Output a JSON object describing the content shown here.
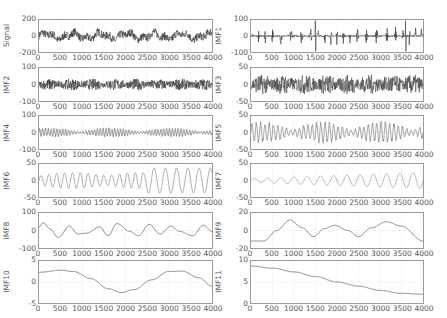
{
  "chart_data": [
    {
      "type": "line",
      "ylabel": "Signal",
      "xlim": [
        0,
        4000
      ],
      "ylim": [
        -200,
        200
      ],
      "yticks": [
        "200",
        "0",
        "-200"
      ],
      "xticks": [
        "0",
        "500",
        "1000",
        "1500",
        "2000",
        "2500",
        "3000",
        "3500",
        "4000"
      ],
      "grid": true,
      "style": "noise",
      "amp": 0.55,
      "freq": 0,
      "line_color": "#333333"
    },
    {
      "type": "line",
      "ylabel": "IMF1",
      "xlim": [
        0,
        4000
      ],
      "ylim": [
        -100,
        100
      ],
      "yticks": [
        "100",
        "0",
        "-100"
      ],
      "xticks": [
        "0",
        "500",
        "1000",
        "1500",
        "2000",
        "2500",
        "3000",
        "3500",
        "4000"
      ],
      "grid": true,
      "style": "bursts",
      "amp": 0.6,
      "freq": 0,
      "line_color": "#333333"
    },
    {
      "type": "line",
      "ylabel": "IMF2",
      "xlim": [
        0,
        4000
      ],
      "ylim": [
        -100,
        100
      ],
      "yticks": [
        "100",
        "0",
        "-100"
      ],
      "xticks": [
        "0",
        "500",
        "1000",
        "1500",
        "2000",
        "2500",
        "3000",
        "3500",
        "4000"
      ],
      "grid": true,
      "style": "dense",
      "amp": 0.35,
      "freq": 0,
      "line_color": "#333333"
    },
    {
      "type": "line",
      "ylabel": "IMF3",
      "xlim": [
        0,
        4000
      ],
      "ylim": [
        -50,
        50
      ],
      "yticks": [
        "50",
        "0",
        "-50"
      ],
      "xticks": [
        "0",
        "500",
        "1000",
        "1500",
        "2000",
        "2500",
        "3000",
        "3500",
        "4000"
      ],
      "grid": true,
      "style": "dense",
      "amp": 0.6,
      "freq": 0,
      "line_color": "#444444"
    },
    {
      "type": "line",
      "ylabel": "IMF4",
      "xlim": [
        0,
        4000
      ],
      "ylim": [
        -100,
        100
      ],
      "yticks": [
        "100",
        "0",
        "-100"
      ],
      "xticks": [
        "0",
        "500",
        "1000",
        "1500",
        "2000",
        "2500",
        "3000",
        "3500",
        "4000"
      ],
      "grid": true,
      "style": "mod",
      "amp": 0.3,
      "freq": 60,
      "line_color": "#555555"
    },
    {
      "type": "line",
      "ylabel": "IMF5",
      "xlim": [
        0,
        4000
      ],
      "ylim": [
        -50,
        50
      ],
      "yticks": [
        "50",
        "0",
        "-50"
      ],
      "xticks": [
        "0",
        "500",
        "1000",
        "1500",
        "2000",
        "2500",
        "3000",
        "3500",
        "4000"
      ],
      "grid": true,
      "style": "mod",
      "amp": 0.7,
      "freq": 40,
      "line_color": "#666666"
    },
    {
      "type": "line",
      "ylabel": "IMF6",
      "xlim": [
        0,
        4000
      ],
      "ylim": [
        -50,
        50
      ],
      "yticks": [
        "50",
        "0",
        "-50"
      ],
      "xticks": [
        "0",
        "500",
        "1000",
        "1500",
        "2000",
        "2500",
        "3000",
        "3500",
        "4000"
      ],
      "grid": true,
      "style": "mod6",
      "amp": 0.8,
      "freq": 22,
      "line_color": "#777777"
    },
    {
      "type": "line",
      "ylabel": "IMF7",
      "xlim": [
        0,
        4000
      ],
      "ylim": [
        -50,
        50
      ],
      "yticks": [
        "50",
        "0",
        "-50"
      ],
      "xticks": [
        "0",
        "500",
        "1000",
        "1500",
        "2000",
        "2500",
        "3000",
        "3500",
        "4000"
      ],
      "grid": true,
      "style": "grow",
      "amp": 0.55,
      "freq": 13,
      "line_color": "#888888"
    },
    {
      "type": "line",
      "ylabel": "IMF8",
      "xlim": [
        0,
        4000
      ],
      "ylim": [
        -100,
        100
      ],
      "yticks": [
        "100",
        "0",
        "-100"
      ],
      "xticks": [
        "0",
        "500",
        "1000",
        "1500",
        "2000",
        "2500",
        "3000",
        "3500",
        "4000"
      ],
      "grid": true,
      "style": "points",
      "points": [
        [
          0,
          20
        ],
        [
          100,
          45
        ],
        [
          250,
          10
        ],
        [
          450,
          -40
        ],
        [
          700,
          25
        ],
        [
          900,
          -20
        ],
        [
          1100,
          -15
        ],
        [
          1400,
          20
        ],
        [
          1600,
          -30
        ],
        [
          1800,
          40
        ],
        [
          2100,
          -5
        ],
        [
          2300,
          -30
        ],
        [
          2550,
          35
        ],
        [
          2800,
          -20
        ],
        [
          3050,
          25
        ],
        [
          3250,
          -5
        ],
        [
          3550,
          -30
        ],
        [
          3800,
          30
        ],
        [
          4000,
          -5
        ]
      ],
      "line_color": "#888888"
    },
    {
      "type": "line",
      "ylabel": "IMF9",
      "xlim": [
        0,
        4000
      ],
      "ylim": [
        -20,
        20
      ],
      "yticks": [
        "20",
        "0",
        "-20"
      ],
      "xticks": [
        "0",
        "500",
        "1000",
        "1500",
        "2000",
        "2500",
        "3000",
        "3500",
        "4000"
      ],
      "grid": true,
      "style": "points",
      "points": [
        [
          0,
          -12
        ],
        [
          300,
          -12
        ],
        [
          600,
          0
        ],
        [
          900,
          12
        ],
        [
          1200,
          3
        ],
        [
          1450,
          -7
        ],
        [
          1700,
          2
        ],
        [
          1950,
          6
        ],
        [
          2250,
          0
        ],
        [
          2500,
          -7
        ],
        [
          2800,
          3
        ],
        [
          3150,
          10
        ],
        [
          3500,
          5
        ],
        [
          4000,
          -12
        ]
      ],
      "line_color": "#888888"
    },
    {
      "type": "line",
      "ylabel": "IMF10",
      "xlim": [
        0,
        4000
      ],
      "ylim": [
        -5,
        5
      ],
      "yticks": [
        "5",
        "0",
        "-5"
      ],
      "xticks": [
        "0",
        "500",
        "1000",
        "1500",
        "2000",
        "2500",
        "3000",
        "3500",
        "4000"
      ],
      "grid": true,
      "style": "points",
      "points": [
        [
          0,
          2.3
        ],
        [
          500,
          2.8
        ],
        [
          800,
          2.5
        ],
        [
          1200,
          0.8
        ],
        [
          1600,
          -1.6
        ],
        [
          1900,
          -2.5
        ],
        [
          2200,
          -1.8
        ],
        [
          2600,
          0.5
        ],
        [
          3000,
          2.5
        ],
        [
          3300,
          2.6
        ],
        [
          3700,
          1.0
        ],
        [
          4000,
          -1.0
        ]
      ],
      "line_color": "#888888"
    },
    {
      "type": "line",
      "ylabel": "IMF11",
      "xlim": [
        0,
        4000
      ],
      "ylim": [
        0,
        10
      ],
      "yticks": [
        "10",
        "5",
        "0"
      ],
      "xticks": [
        "0",
        "500",
        "1000",
        "1500",
        "2000",
        "2500",
        "3000",
        "3500",
        "4000"
      ],
      "grid": true,
      "style": "points",
      "points": [
        [
          0,
          8.8
        ],
        [
          500,
          8.3
        ],
        [
          1000,
          7.4
        ],
        [
          1500,
          6.3
        ],
        [
          2000,
          5.0
        ],
        [
          2500,
          4.0
        ],
        [
          3000,
          3.0
        ],
        [
          3500,
          2.3
        ],
        [
          4000,
          2.1
        ]
      ],
      "line_color": "#888888"
    }
  ]
}
